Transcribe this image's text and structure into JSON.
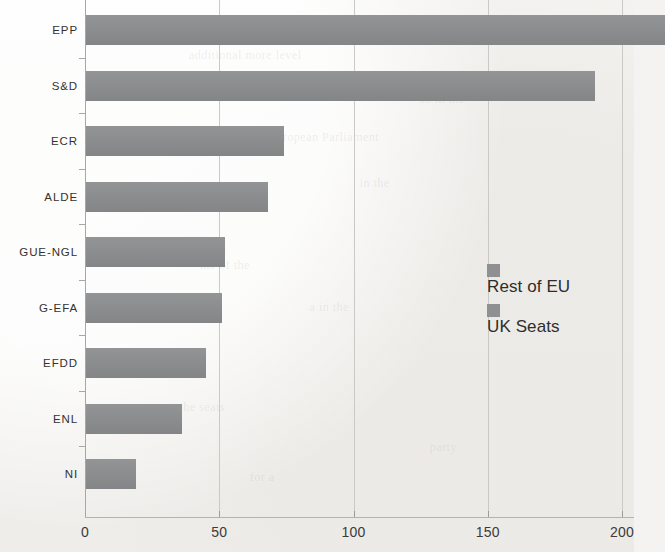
{
  "chart_data": {
    "type": "bar",
    "orientation": "horizontal",
    "title": "",
    "xlabel": "",
    "ylabel": "",
    "categories": [
      "EPP",
      "S&D",
      "ECR",
      "ALDE",
      "GUE-NGL",
      "G-EFA",
      "EFDD",
      "ENL",
      "NI"
    ],
    "series": [
      {
        "name": "Rest of EU",
        "values": [
          216,
          190,
          74,
          68,
          52,
          51,
          45,
          36,
          19
        ]
      }
    ],
    "xlim": [
      0,
      200
    ],
    "xticks": [
      0,
      50,
      100,
      150,
      200
    ],
    "xtick_labels": [
      "0",
      "50",
      "100",
      "150",
      "200"
    ],
    "grid": "vertical",
    "note": "EPP bar extends past the right edge of the cropped image",
    "legend": {
      "position": "center-right",
      "entries": [
        {
          "label": "Rest of EU",
          "color": "#8e9092"
        },
        {
          "label": "UK Seats",
          "color": "#8e9092"
        }
      ]
    },
    "colors": {
      "bar": "#8a8c8e",
      "background": "#f4f3f1",
      "gridline": "#cbc9c5",
      "axis": "#a9a7a3",
      "text": "#33322f"
    }
  },
  "ghost_text": [
    "additional more level",
    "so in the",
    "the European Parliament",
    "in the",
    "the of the",
    "a in the",
    "the seats",
    "party",
    "for a"
  ]
}
